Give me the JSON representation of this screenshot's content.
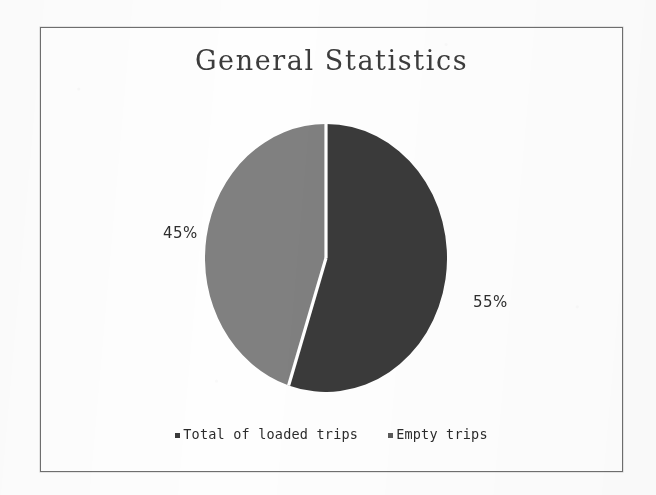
{
  "document": {
    "background_color": "#fdfdfd",
    "frame_border_color": "#6f6f6f"
  },
  "chart": {
    "title": "General Statistics",
    "labels": {
      "loaded": "55%",
      "empty": "45%"
    },
    "legend": [
      {
        "label": "Total of loaded trips",
        "color": "#3a3a3a",
        "marker": "square-marker"
      },
      {
        "label": "Empty trips",
        "color": "#808080",
        "marker": "square-marker"
      }
    ]
  },
  "chart_data": {
    "type": "pie",
    "title": "General Statistics",
    "categories": [
      "Total of loaded trips",
      "Empty trips"
    ],
    "values": [
      55,
      45
    ],
    "data_labels": [
      "55%",
      "45%"
    ],
    "unit": "%",
    "colors": [
      "#3a3a3a",
      "#808080"
    ],
    "slice_border_color": "#ffffff",
    "start_angle_deg": 0,
    "direction": "clockwise",
    "legend": {
      "position": "bottom",
      "entries": [
        "Total of loaded trips",
        "Empty trips"
      ]
    },
    "grid": false,
    "xlabel": "",
    "ylabel": ""
  }
}
